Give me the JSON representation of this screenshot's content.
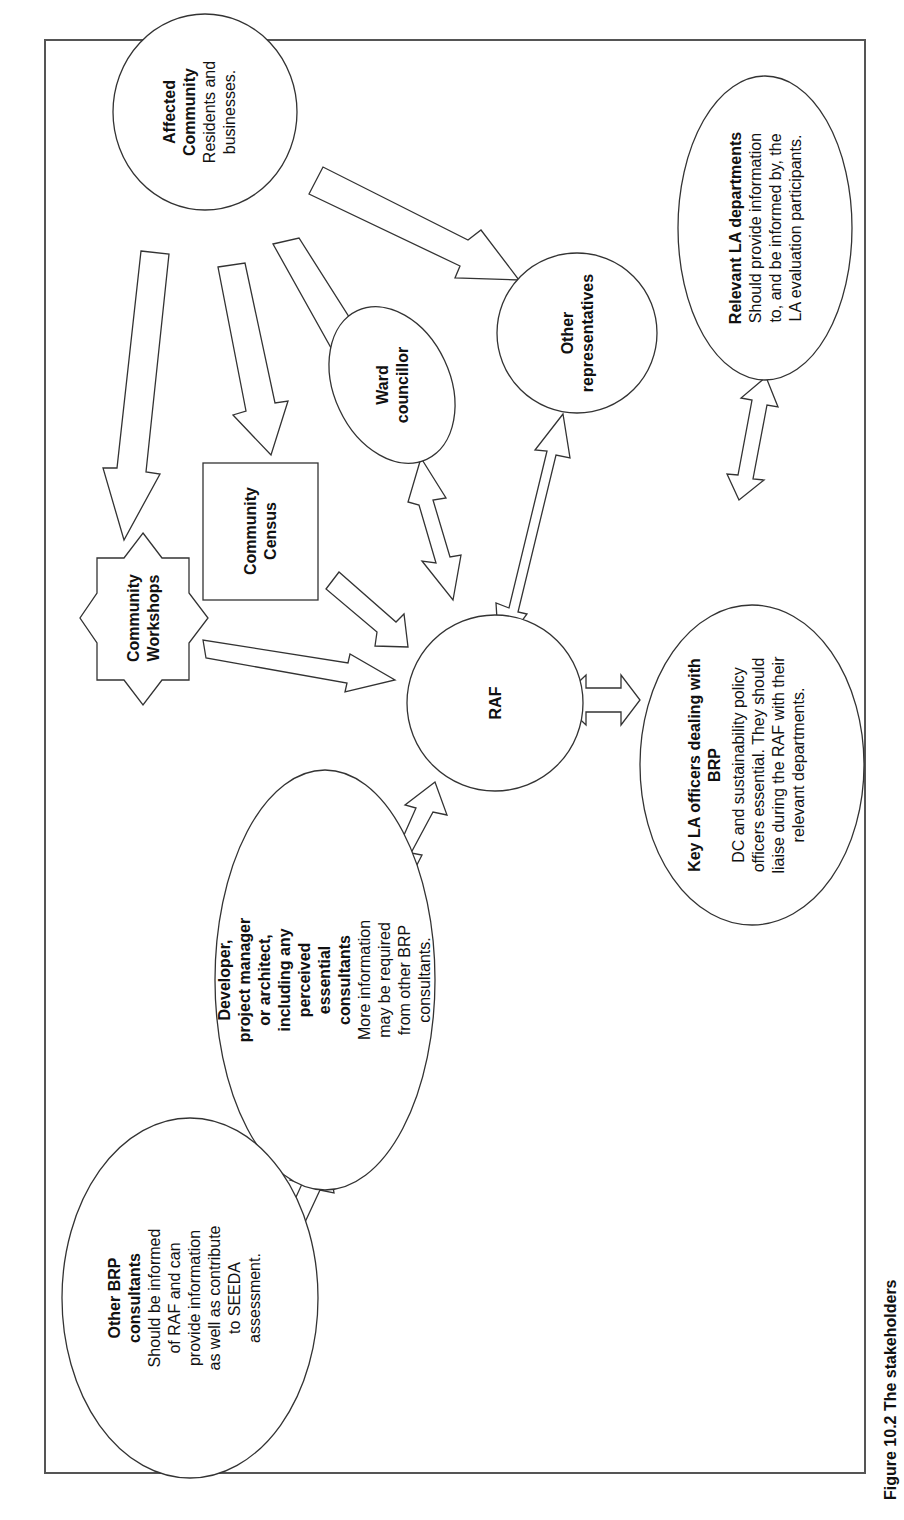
{
  "figure": {
    "orientation": "rotated-90-ccw",
    "caption_partial": "Figure 10.2  The stakeholders"
  },
  "nodes": {
    "affected_community": {
      "title1": "Affected",
      "title2": "Community",
      "body1": "Residents and",
      "body2": "businesses."
    },
    "other_representatives": {
      "title1": "Other",
      "title2": "representatives"
    },
    "relevant_la": {
      "title": "Relevant LA departments",
      "body1": "Should provide information",
      "body2": "to, and be informed by, the",
      "body3": "LA evaluation participants."
    },
    "ward_councillor": {
      "title1": "Ward",
      "title2": "councillor"
    },
    "community_census": {
      "title1": "Community",
      "title2": "Census"
    },
    "community_workshops": {
      "title1": "Community",
      "title2": "Workshops"
    },
    "raf": {
      "title": "RAF"
    },
    "key_la": {
      "title1": "Key LA officers dealing with",
      "title2": "BRP",
      "body1": "DC and sustainability policy",
      "body2": "officers essential. They should",
      "body3": "liaise during the RAF with their",
      "body4": "relevant departments."
    },
    "developer": {
      "title1": "Developer,",
      "title2": "project manager",
      "title3": "or architect,",
      "title4": "including any",
      "title5": "perceived",
      "title6": "essential",
      "title7": "consultants",
      "body1": "More information",
      "body2": "may be required",
      "body3": "from other BRP",
      "body4": "consultants."
    },
    "other_brp": {
      "title1": "Other BRP",
      "title2": "consultants",
      "body1": "Should be informed",
      "body2": "of RAF and can",
      "body3": "provide information",
      "body4": "as well as contribute",
      "body5": "to SEEDA",
      "body6": "assessment."
    }
  },
  "edges": [
    {
      "from": "Affected Community",
      "to": "Community Workshops",
      "type": "one-way"
    },
    {
      "from": "Affected Community",
      "to": "Community Census",
      "type": "one-way"
    },
    {
      "from": "Affected Community",
      "to": "Ward councillor",
      "type": "one-way"
    },
    {
      "from": "Affected Community",
      "to": "Other representatives",
      "type": "one-way"
    },
    {
      "from": "Community Workshops",
      "to": "RAF",
      "type": "one-way"
    },
    {
      "from": "Community Census",
      "to": "RAF",
      "type": "one-way"
    },
    {
      "from": "Ward councillor",
      "to": "RAF",
      "type": "two-way"
    },
    {
      "from": "Other representatives",
      "to": "RAF",
      "type": "two-way"
    },
    {
      "from": "RAF",
      "to": "Key LA officers dealing with BRP",
      "type": "two-way"
    },
    {
      "from": "Key LA officers dealing with BRP",
      "to": "Relevant LA departments",
      "type": "two-way"
    },
    {
      "from": "RAF",
      "to": "Developer",
      "type": "two-way"
    },
    {
      "from": "Developer",
      "to": "Other BRP consultants",
      "type": "two-way"
    }
  ]
}
